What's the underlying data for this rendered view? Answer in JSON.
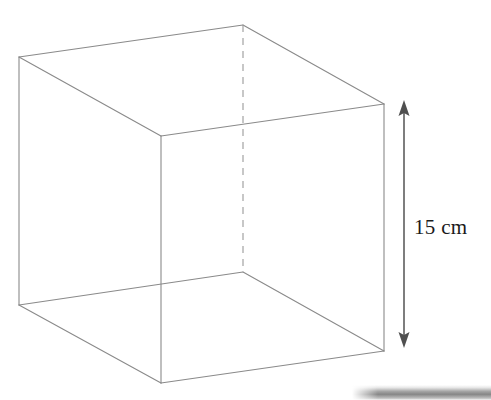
{
  "figure": {
    "shape_name": "cube",
    "stroke_color": "#8a8a8a",
    "dashed_stroke_color": "#9a9a9a",
    "arrow_color": "#5a5a5a",
    "background_color": "#ffffff",
    "stroke_width": 1,
    "vertices": {
      "top_left": [
        19,
        57
      ],
      "top_back": [
        243,
        25
      ],
      "top_right": [
        384,
        104
      ],
      "top_front": [
        161,
        136
      ],
      "bottom_left": [
        19,
        305
      ],
      "bottom_back": [
        243,
        272
      ],
      "bottom_right": [
        384,
        351
      ],
      "bottom_front": [
        161,
        383
      ]
    },
    "solid_edges": [
      [
        "top_left",
        "top_back"
      ],
      [
        "top_back",
        "top_right"
      ],
      [
        "top_right",
        "top_front"
      ],
      [
        "top_front",
        "top_left"
      ],
      [
        "top_left",
        "bottom_left"
      ],
      [
        "top_right",
        "bottom_right"
      ],
      [
        "top_front",
        "bottom_front"
      ],
      [
        "bottom_left",
        "bottom_front"
      ],
      [
        "bottom_front",
        "bottom_right"
      ],
      [
        "bottom_left",
        "bottom_back"
      ],
      [
        "bottom_back",
        "bottom_right"
      ]
    ],
    "dashed_edges": [
      [
        "top_back",
        "bottom_back"
      ]
    ]
  },
  "dimension": {
    "label": "15 cm",
    "value": 15,
    "unit": "cm",
    "measures": "height",
    "arrow": {
      "x": 404,
      "y_top": 101,
      "y_bottom": 347,
      "double_headed": true
    }
  },
  "artifact": {
    "name": "scan-shadow-band",
    "description": "gray scanned page edge shadow at bottom right"
  }
}
